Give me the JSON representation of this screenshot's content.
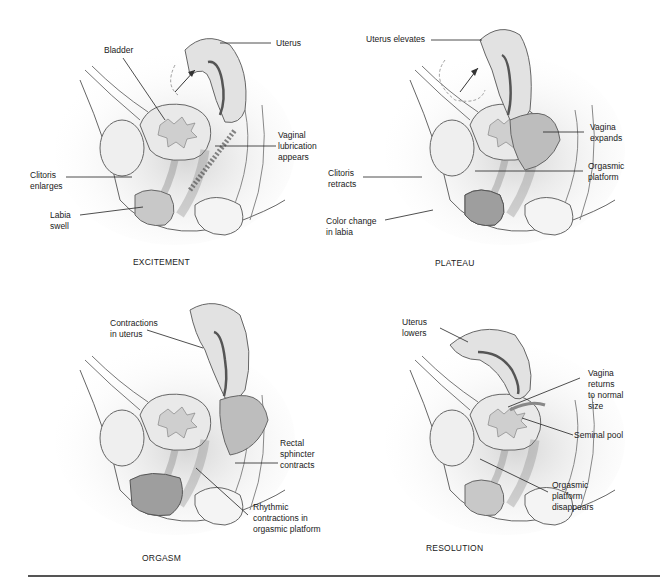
{
  "figure": {
    "panels": [
      {
        "id": "excitement",
        "caption": "EXCITEMENT",
        "labels": [
          {
            "text": "Bladder"
          },
          {
            "text": "Uterus"
          },
          {
            "text": "Vaginal\nlubrication\nappears"
          },
          {
            "text": "Clitoris\nenlarges"
          },
          {
            "text": "Labia\nswell"
          }
        ]
      },
      {
        "id": "plateau",
        "caption": "PLATEAU",
        "labels": [
          {
            "text": "Uterus elevates"
          },
          {
            "text": "Vagina\nexpands"
          },
          {
            "text": "Clitoris\nretracts"
          },
          {
            "text": "Orgasmic\nplatform"
          },
          {
            "text": "Color change\nin labia"
          }
        ]
      },
      {
        "id": "orgasm",
        "caption": "ORGASM",
        "labels": [
          {
            "text": "Contractions\nin uterus"
          },
          {
            "text": "Rectal\nsphincter\ncontracts"
          },
          {
            "text": "Rhythmic\ncontractions in\norgasmic platform"
          }
        ]
      },
      {
        "id": "resolution",
        "caption": "RESOLUTION",
        "labels": [
          {
            "text": "Uterus\nlowers"
          },
          {
            "text": "Vagina\nreturns\nto normal\nsize"
          },
          {
            "text": "Seminal pool"
          },
          {
            "text": "Orgasmic\nplatform\ndisappears"
          }
        ]
      }
    ],
    "colors": {
      "outline": "#555555",
      "tissue_light": "#e4e4e4",
      "tissue_mid": "#c9c9c9",
      "tissue_dark": "#9a9a9a",
      "background": "#ffffff"
    }
  }
}
